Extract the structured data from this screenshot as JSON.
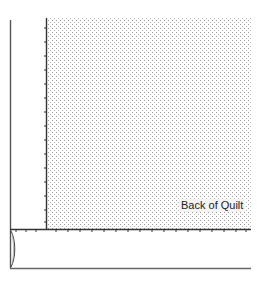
{
  "diagram": {
    "label": "Back of Quilt",
    "colors": {
      "line": "#555555",
      "stitch": "#333333",
      "dot": "#9a9a9a",
      "background": "#ffffff"
    },
    "geometry": {
      "outer_left_x": 10,
      "inner_left_x": 46,
      "top_y": 18,
      "stitch_y": 229,
      "bottom_y": 268,
      "right_x": 251
    }
  }
}
